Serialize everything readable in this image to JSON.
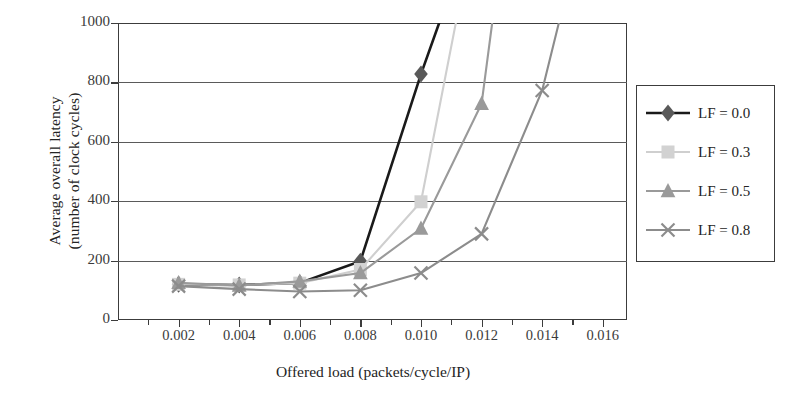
{
  "chart_data": {
    "type": "line",
    "title": "",
    "xlabel": "Offered load (packets/cycle/IP)",
    "ylabel_line1": "Average overall latency",
    "ylabel_line2": "(number of clock cycles)",
    "xlim": [
      0.0,
      0.0168
    ],
    "ylim": [
      0,
      1000
    ],
    "xticks": [
      0.002,
      0.004,
      0.006,
      0.008,
      0.01,
      0.012,
      0.014,
      0.016
    ],
    "xtick_labels": [
      "0.002",
      "0.004",
      "0.006",
      "0.008",
      "0.010",
      "0.012",
      "0.014",
      "0.016"
    ],
    "yticks": [
      0,
      200,
      400,
      600,
      800,
      1000
    ],
    "ytick_labels": [
      "0",
      "200",
      "400",
      "600",
      "800",
      "1000"
    ],
    "grid": "horizontal",
    "legend_position": "right-outside",
    "series": [
      {
        "name": "LF = 0.0",
        "marker": "diamond",
        "color": "#1a1a1a",
        "marker_color": "#595959",
        "x": [
          0.002,
          0.004,
          0.006,
          0.008,
          0.01,
          0.0106
        ],
        "y": [
          120,
          118,
          125,
          198,
          828,
          1000
        ]
      },
      {
        "name": "LF = 0.3",
        "marker": "square",
        "color": "#cfcfcf",
        "marker_color": "#d2d2d2",
        "x": [
          0.002,
          0.004,
          0.006,
          0.008,
          0.01,
          0.01115
        ],
        "y": [
          120,
          118,
          124,
          170,
          398,
          1000
        ]
      },
      {
        "name": "LF = 0.5",
        "marker": "triangle",
        "color": "#9a9a9a",
        "marker_color": "#9a9a9a",
        "x": [
          0.002,
          0.004,
          0.006,
          0.008,
          0.01,
          0.012,
          0.01235
        ],
        "y": [
          125,
          116,
          130,
          158,
          308,
          728,
          1000
        ]
      },
      {
        "name": "LF = 0.8",
        "marker": "x",
        "color": "#8c8c8c",
        "marker_color": "#8c8c8c",
        "x": [
          0.002,
          0.004,
          0.006,
          0.008,
          0.01,
          0.012,
          0.014,
          0.01455
        ],
        "y": [
          114,
          104,
          96,
          100,
          158,
          290,
          773,
          1000
        ]
      }
    ]
  },
  "legend": {
    "items": [
      {
        "label": "LF = 0.0",
        "marker": "diamond-marker",
        "color": "#1a1a1a",
        "marker_color": "#595959"
      },
      {
        "label": "LF = 0.3",
        "marker": "square-marker",
        "color": "#cfcfcf",
        "marker_color": "#d2d2d2"
      },
      {
        "label": "LF = 0.5",
        "marker": "triangle-marker",
        "color": "#9a9a9a",
        "marker_color": "#9a9a9a"
      },
      {
        "label": "LF = 0.8",
        "marker": "x-marker",
        "color": "#8c8c8c",
        "marker_color": "#8c8c8c"
      }
    ]
  }
}
